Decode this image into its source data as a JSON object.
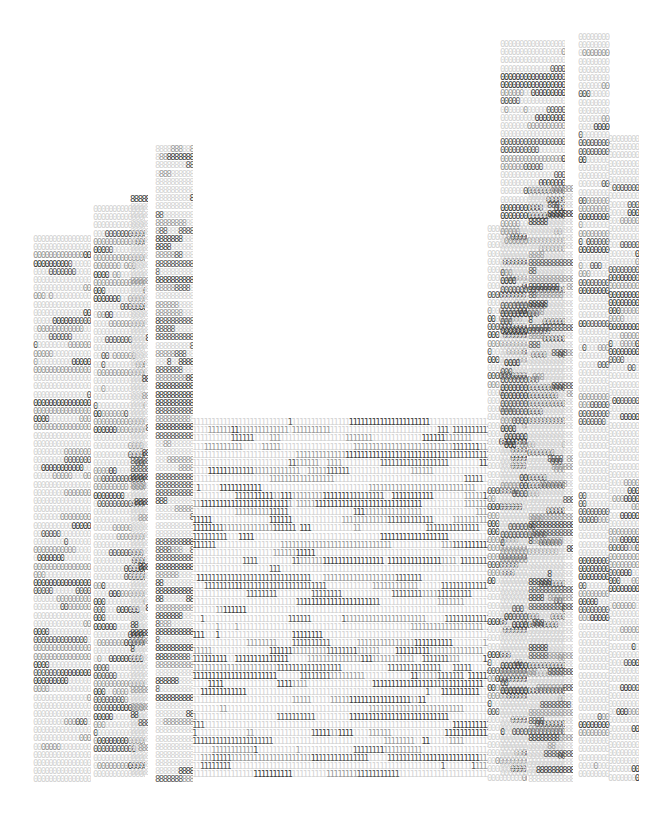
{
  "artwork": {
    "subject": "typographic cityscape",
    "glyphs": [
      "0",
      "8",
      "9",
      "1"
    ],
    "palette": {
      "background": "#ffffff",
      "light": "#d4d4d4",
      "mid": "#9a9a9a",
      "dark": "#585858",
      "darkest": "#3e3e3e"
    }
  },
  "buildings": [
    {
      "name": "building-far-left",
      "x": 33,
      "y": 235,
      "w": 58,
      "h": 550,
      "glyph": "0",
      "seed": 3,
      "density": 0.35
    },
    {
      "name": "building-left-2",
      "x": 93,
      "y": 205,
      "w": 52,
      "h": 580,
      "glyph": "0",
      "seed": 7,
      "density": 0.45
    },
    {
      "name": "building-left-3",
      "x": 130,
      "y": 195,
      "w": 18,
      "h": 590,
      "glyph": "8",
      "seed": 11,
      "density": 0.3
    },
    {
      "name": "building-left-tower",
      "x": 155,
      "y": 145,
      "w": 38,
      "h": 640,
      "glyph": "8",
      "seed": 13,
      "density": 0.5
    },
    {
      "name": "building-center-low",
      "x": 192,
      "y": 418,
      "w": 296,
      "h": 367,
      "glyph": "1",
      "seed": 17,
      "density": 0.55
    },
    {
      "name": "building-right-1",
      "x": 487,
      "y": 225,
      "w": 40,
      "h": 560,
      "glyph": "0",
      "seed": 19,
      "density": 0.45
    },
    {
      "name": "building-right-2",
      "x": 500,
      "y": 40,
      "w": 65,
      "h": 745,
      "glyph": "0",
      "seed": 23,
      "density": 0.4
    },
    {
      "name": "building-right-3",
      "x": 528,
      "y": 185,
      "w": 45,
      "h": 600,
      "glyph": "8",
      "seed": 29,
      "density": 0.45
    },
    {
      "name": "building-right-tower",
      "x": 578,
      "y": 33,
      "w": 32,
      "h": 752,
      "glyph": "0",
      "seed": 31,
      "density": 0.4
    },
    {
      "name": "building-far-right",
      "x": 608,
      "y": 135,
      "w": 31,
      "h": 650,
      "glyph": "0",
      "seed": 37,
      "density": 0.45
    }
  ]
}
